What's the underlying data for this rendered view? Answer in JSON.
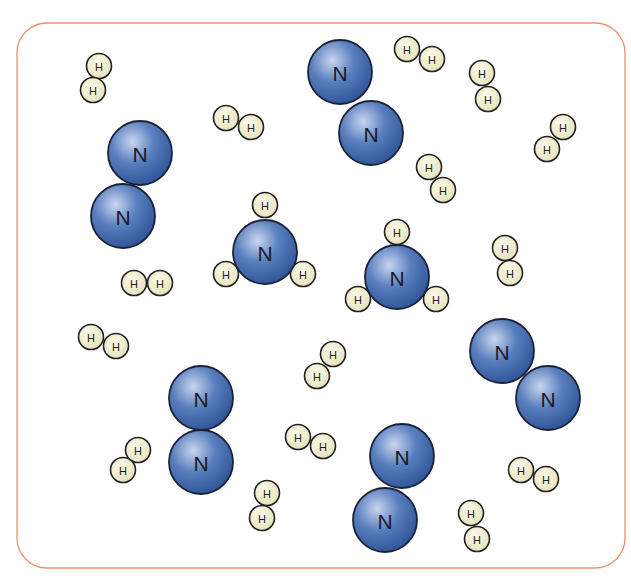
{
  "diagram": {
    "title": "",
    "container": {
      "x": 17,
      "y": 23,
      "width": 608,
      "height": 545,
      "radius": 30,
      "stroke": "#f0916a"
    },
    "colors": {
      "nitrogen_fill_light": "#c9d6ee",
      "nitrogen_fill_mid": "#5a7fbf",
      "nitrogen_fill_dark": "#2a4f93",
      "nitrogen_stroke": "#1a2236",
      "hydrogen_fill_light": "#fbf9e8",
      "hydrogen_fill_dark": "#e4e0b8",
      "hydrogen_stroke": "#222222"
    },
    "radii": {
      "N": 32,
      "H": 12.5
    },
    "legend": [],
    "molecules": [
      {
        "type": "N2",
        "atoms": [
          {
            "el": "N",
            "label": "N",
            "x": 340,
            "y": 72
          },
          {
            "el": "N",
            "label": "N",
            "x": 371,
            "y": 133
          }
        ]
      },
      {
        "type": "N2",
        "atoms": [
          {
            "el": "N",
            "label": "N",
            "x": 140,
            "y": 153
          },
          {
            "el": "N",
            "label": "N",
            "x": 123,
            "y": 216
          }
        ]
      },
      {
        "type": "N2",
        "atoms": [
          {
            "el": "N",
            "label": "N",
            "x": 201,
            "y": 398
          },
          {
            "el": "N",
            "label": "N",
            "x": 201,
            "y": 462
          }
        ]
      },
      {
        "type": "N2",
        "atoms": [
          {
            "el": "N",
            "label": "N",
            "x": 502,
            "y": 351
          },
          {
            "el": "N",
            "label": "N",
            "x": 548,
            "y": 398
          }
        ]
      },
      {
        "type": "N2",
        "atoms": [
          {
            "el": "N",
            "label": "N",
            "x": 402,
            "y": 456
          },
          {
            "el": "N",
            "label": "N",
            "x": 385,
            "y": 520
          }
        ]
      },
      {
        "type": "NH3",
        "atoms": [
          {
            "el": "H",
            "label": "H",
            "x": 265,
            "y": 205
          },
          {
            "el": "H",
            "label": "H",
            "x": 226,
            "y": 274
          },
          {
            "el": "H",
            "label": "H",
            "x": 303,
            "y": 274
          },
          {
            "el": "N",
            "label": "N",
            "x": 265,
            "y": 252
          }
        ]
      },
      {
        "type": "NH3",
        "atoms": [
          {
            "el": "H",
            "label": "H",
            "x": 397,
            "y": 232
          },
          {
            "el": "H",
            "label": "H",
            "x": 358,
            "y": 299
          },
          {
            "el": "H",
            "label": "H",
            "x": 436,
            "y": 299
          },
          {
            "el": "N",
            "label": "N",
            "x": 397,
            "y": 277
          }
        ]
      },
      {
        "type": "H2",
        "atoms": [
          {
            "el": "H",
            "label": "H",
            "x": 99,
            "y": 66
          },
          {
            "el": "H",
            "label": "H",
            "x": 93,
            "y": 90
          }
        ]
      },
      {
        "type": "H2",
        "atoms": [
          {
            "el": "H",
            "label": "H",
            "x": 226,
            "y": 118
          },
          {
            "el": "H",
            "label": "H",
            "x": 251,
            "y": 127
          }
        ]
      },
      {
        "type": "H2",
        "atoms": [
          {
            "el": "H",
            "label": "H",
            "x": 407,
            "y": 49
          },
          {
            "el": "H",
            "label": "H",
            "x": 432,
            "y": 59
          }
        ]
      },
      {
        "type": "H2",
        "atoms": [
          {
            "el": "H",
            "label": "H",
            "x": 482,
            "y": 73
          },
          {
            "el": "H",
            "label": "H",
            "x": 488,
            "y": 99
          }
        ]
      },
      {
        "type": "H2",
        "atoms": [
          {
            "el": "H",
            "label": "H",
            "x": 563,
            "y": 127
          },
          {
            "el": "H",
            "label": "H",
            "x": 547,
            "y": 149
          }
        ]
      },
      {
        "type": "H2",
        "atoms": [
          {
            "el": "H",
            "label": "H",
            "x": 429,
            "y": 167
          },
          {
            "el": "H",
            "label": "H",
            "x": 443,
            "y": 190
          }
        ]
      },
      {
        "type": "H2",
        "atoms": [
          {
            "el": "H",
            "label": "H",
            "x": 505,
            "y": 248
          },
          {
            "el": "H",
            "label": "H",
            "x": 510,
            "y": 273
          }
        ]
      },
      {
        "type": "H2",
        "atoms": [
          {
            "el": "H",
            "label": "H",
            "x": 134,
            "y": 283
          },
          {
            "el": "H",
            "label": "H",
            "x": 160,
            "y": 283
          }
        ]
      },
      {
        "type": "H2",
        "atoms": [
          {
            "el": "H",
            "label": "H",
            "x": 91,
            "y": 337
          },
          {
            "el": "H",
            "label": "H",
            "x": 116,
            "y": 346
          }
        ]
      },
      {
        "type": "H2",
        "atoms": [
          {
            "el": "H",
            "label": "H",
            "x": 333,
            "y": 354
          },
          {
            "el": "H",
            "label": "H",
            "x": 317,
            "y": 376
          }
        ]
      },
      {
        "type": "H2",
        "atoms": [
          {
            "el": "H",
            "label": "H",
            "x": 138,
            "y": 450
          },
          {
            "el": "H",
            "label": "H",
            "x": 123,
            "y": 470
          }
        ]
      },
      {
        "type": "H2",
        "atoms": [
          {
            "el": "H",
            "label": "H",
            "x": 298,
            "y": 437
          },
          {
            "el": "H",
            "label": "H",
            "x": 323,
            "y": 446
          }
        ]
      },
      {
        "type": "H2",
        "atoms": [
          {
            "el": "H",
            "label": "H",
            "x": 267,
            "y": 493
          },
          {
            "el": "H",
            "label": "H",
            "x": 262,
            "y": 518
          }
        ]
      },
      {
        "type": "H2",
        "atoms": [
          {
            "el": "H",
            "label": "H",
            "x": 521,
            "y": 470
          },
          {
            "el": "H",
            "label": "H",
            "x": 546,
            "y": 479
          }
        ]
      },
      {
        "type": "H2",
        "atoms": [
          {
            "el": "H",
            "label": "H",
            "x": 471,
            "y": 513
          },
          {
            "el": "H",
            "label": "H",
            "x": 477,
            "y": 539
          }
        ]
      }
    ],
    "counts": {
      "N2": 5,
      "NH3": 2,
      "H2": 15
    }
  }
}
